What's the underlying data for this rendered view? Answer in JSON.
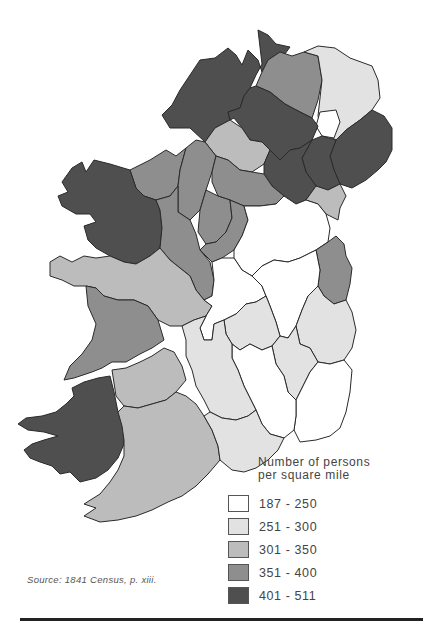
{
  "map": {
    "subject": "Population density of Ireland by county, 1841",
    "classes": [
      {
        "label": "187 - 250",
        "color": "#ffffff"
      },
      {
        "label": "251 - 300",
        "color": "#e2e2e2"
      },
      {
        "label": "301 - 350",
        "color": "#bcbcbc"
      },
      {
        "label": "351 - 400",
        "color": "#8e8e8e"
      },
      {
        "label": "401 - 511",
        "color": "#4f4f4f"
      }
    ]
  },
  "legend": {
    "title_line1": "Number of persons",
    "title_line2": "per square mile",
    "items": [
      {
        "label": "187 - 250",
        "color": "#ffffff"
      },
      {
        "label": "251 - 300",
        "color": "#e2e2e2"
      },
      {
        "label": "301 - 350",
        "color": "#bcbcbc"
      },
      {
        "label": "351 - 400",
        "color": "#8e8e8e"
      },
      {
        "label": "401 - 511",
        "color": "#4f4f4f"
      }
    ]
  },
  "source": "Source: 1841 Census, p. xiii."
}
